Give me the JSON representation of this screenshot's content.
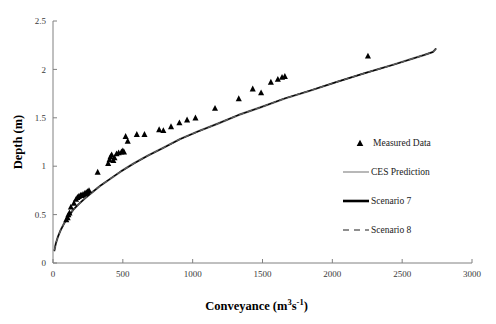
{
  "chart_data": {
    "type": "scatter",
    "title": "",
    "xlabel": "Conveyance (m3s-1)",
    "xlabel_parts": {
      "text": "Conveyance (m",
      "sup1": "3",
      "mid": "s",
      "sup2": "-1",
      "tail": ")"
    },
    "ylabel": "Depth (m)",
    "xlim": [
      0,
      3000
    ],
    "ylim": [
      0,
      2.5
    ],
    "xticks": [
      0,
      500,
      1000,
      1500,
      2000,
      2500,
      3000
    ],
    "xtick_labels": [
      "0",
      "500",
      "1000",
      "1500",
      "2000",
      "2500",
      "3000"
    ],
    "yticks": [
      0,
      0.5,
      1,
      1.5,
      2,
      2.5
    ],
    "ytick_labels": [
      "0",
      "0.5",
      "1",
      "1.5",
      "2",
      "2.5"
    ],
    "grid": false,
    "legend_position": "right",
    "series": [
      {
        "name": "Measured Data",
        "type": "scatter",
        "marker": "triangle",
        "color": "#000000",
        "points": [
          [
            95,
            0.45
          ],
          [
            105,
            0.47
          ],
          [
            110,
            0.5
          ],
          [
            118,
            0.52
          ],
          [
            128,
            0.58
          ],
          [
            150,
            0.62
          ],
          [
            165,
            0.66
          ],
          [
            175,
            0.68
          ],
          [
            185,
            0.69
          ],
          [
            196,
            0.7
          ],
          [
            205,
            0.7
          ],
          [
            215,
            0.71
          ],
          [
            228,
            0.72
          ],
          [
            238,
            0.73
          ],
          [
            248,
            0.74
          ],
          [
            258,
            0.75
          ],
          [
            320,
            0.94
          ],
          [
            395,
            1.03
          ],
          [
            405,
            1.07
          ],
          [
            412,
            1.1
          ],
          [
            420,
            1.12
          ],
          [
            432,
            1.06
          ],
          [
            440,
            1.09
          ],
          [
            455,
            1.13
          ],
          [
            470,
            1.14
          ],
          [
            490,
            1.15
          ],
          [
            500,
            1.16
          ],
          [
            508,
            1.15
          ],
          [
            520,
            1.31
          ],
          [
            535,
            1.26
          ],
          [
            600,
            1.33
          ],
          [
            655,
            1.33
          ],
          [
            760,
            1.38
          ],
          [
            790,
            1.37
          ],
          [
            845,
            1.41
          ],
          [
            905,
            1.45
          ],
          [
            960,
            1.48
          ],
          [
            1020,
            1.5
          ],
          [
            1160,
            1.6
          ],
          [
            1330,
            1.7
          ],
          [
            1430,
            1.8
          ],
          [
            1490,
            1.76
          ],
          [
            1560,
            1.87
          ],
          [
            1610,
            1.9
          ],
          [
            1640,
            1.92
          ],
          [
            1660,
            1.93
          ],
          [
            2255,
            2.14
          ]
        ]
      },
      {
        "name": "CES Prediction",
        "type": "line",
        "style": "solid",
        "color": "#9a9a9a",
        "width": 2.2
      },
      {
        "name": "Scenario 7",
        "type": "line",
        "style": "solid",
        "color": "#000000",
        "width": 1.4
      },
      {
        "name": "Scenario 8",
        "type": "line",
        "style": "dashed",
        "color": "#5a5a5a",
        "width": 1.4
      }
    ],
    "prediction_curve": [
      [
        10,
        0.13
      ],
      [
        20,
        0.2
      ],
      [
        35,
        0.27
      ],
      [
        55,
        0.34
      ],
      [
        80,
        0.41
      ],
      [
        110,
        0.48
      ],
      [
        145,
        0.55
      ],
      [
        185,
        0.61
      ],
      [
        230,
        0.67
      ],
      [
        280,
        0.73
      ],
      [
        340,
        0.8
      ],
      [
        410,
        0.87
      ],
      [
        490,
        0.95
      ],
      [
        580,
        1.03
      ],
      [
        680,
        1.11
      ],
      [
        790,
        1.19
      ],
      [
        910,
        1.28
      ],
      [
        1040,
        1.36
      ],
      [
        1180,
        1.44
      ],
      [
        1330,
        1.53
      ],
      [
        1490,
        1.61
      ],
      [
        1660,
        1.7
      ],
      [
        1840,
        1.78
      ],
      [
        2030,
        1.87
      ],
      [
        2230,
        1.96
      ],
      [
        2440,
        2.05
      ],
      [
        2660,
        2.15
      ],
      [
        2720,
        2.18
      ],
      [
        2740,
        2.21
      ]
    ]
  },
  "legend": {
    "items": [
      {
        "label": "Measured Data",
        "swatch": "triangle-marker"
      },
      {
        "label": "CES Prediction",
        "swatch": "solid-grey-line"
      },
      {
        "label": "Scenario 7",
        "swatch": "solid-black-line"
      },
      {
        "label": "Scenario 8",
        "swatch": "dashed-grey-line"
      }
    ]
  }
}
